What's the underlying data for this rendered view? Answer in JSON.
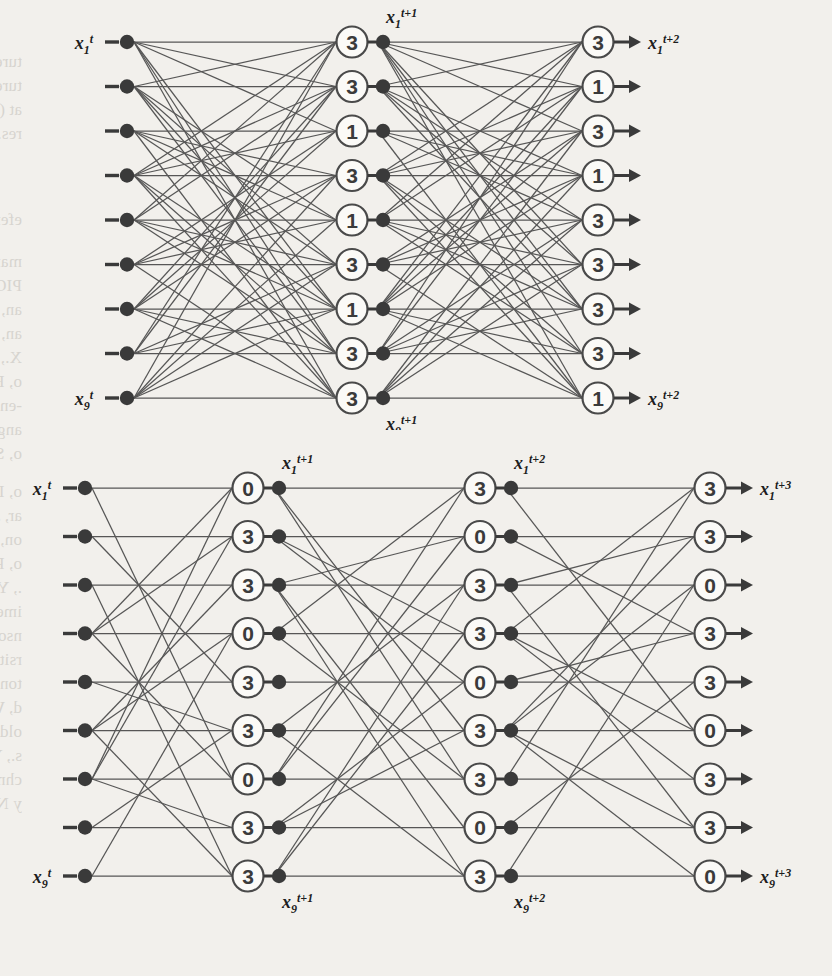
{
  "page": {
    "background_color": "#f2f0ec",
    "ink_color": "#3f3f3f",
    "figure_count": 2
  },
  "bleed_through_text": [
    {
      "t": "ture problems, particularly a novel extension of the CL based learning",
      "x": 22,
      "y": 52
    },
    {
      "t": "tures at the desired point, in addition to the desired PIO, the shift",
      "x": 22,
      "y": 76
    },
    {
      "t": "at (contour slope) BIO curves. In this case, the normalized value is switch",
      "x": 22,
      "y": 100
    },
    {
      "t": "res.",
      "x": 22,
      "y": 124
    },
    {
      "t": "eferences",
      "x": 22,
      "y": 210
    },
    {
      "t": "mand, M., Schoen,  D. :  Deep  Convolutionary  Neural Networks",
      "x": 22,
      "y": 252
    },
    {
      "t": "PIOR From Handwriting.",
      "x": 22,
      "y": 276
    },
    {
      "t": "an, W., Xiong, W.: OUTLI+D (2012) Orient  Binary Neural",
      "x": 22,
      "y": 300
    },
    {
      "t": "an, W.: Learning  CNN-BIO  in  Proc.  IEEE  pp. 1-12 (2017)",
      "x": 22,
      "y": 324
    },
    {
      "t": "X., Xu, S-D., Yao, H.: Deep learning on binary neural networks (2017)",
      "x": 22,
      "y": 348
    },
    {
      "t": "o, R., Santarcangelo, D.: Methods and Learning of Discrete Ordi-",
      "x": 22,
      "y": 372
    },
    {
      "t": "-ended Binary Neural Networks. Int. Proc. LRYY, pp. 302-318 (2012",
      "x": 22,
      "y": 396
    },
    {
      "t": "angelo, A., Suarez, R.: Deep learning for binary neural networks",
      "x": 22,
      "y": 420
    },
    {
      "t": "o, S., Discriminate-neural Networks 3(2), pp.4-2(2) (2019)",
      "x": 22,
      "y": 444
    },
    {
      "t": "o, I.,  Bengio,  Y.: Convolution al Neural network, Proc. IEEE",
      "x": 22,
      "y": 482
    },
    {
      "t": "ar, J.: Deep  learning  of  binary networks, pp. 20-41 (2017)",
      "x": 22,
      "y": 506
    },
    {
      "t": "on, J.: Convolutional  Neural Network  for  Binary  Classification, 10",
      "x": 22,
      "y": 530
    },
    {
      "t": "o, P.: Features  and  Binary  Neural  Network  recognition, 10",
      "x": 22,
      "y": 554
    },
    {
      "t": "., Y., Wang, M.: Binary  network  topologies  and learning, 1, 1",
      "x": 22,
      "y": 578
    },
    {
      "t": "ime-dimensional  processing  Neural  network  pp. 109-204 (2006)",
      "x": 22,
      "y": 602
    },
    {
      "t": "nson, D.: A  fast  learning  algorithms  for  deep  belief  (2006)",
      "x": 22,
      "y": 626
    },
    {
      "t": "rsity  Press, Oxford (2009)",
      "x": 22,
      "y": 650
    },
    {
      "t": "ton, I.E.: Conditional  Restricted  of  Neural  Networks  in  re-",
      "x": 22,
      "y": 674
    },
    {
      "t": "d, W.: Neural  networks  in  conjunction  with  learning, 1 - 11 (1",
      "x": 22,
      "y": 698
    },
    {
      "t": "old, Z.: The  final  negative  memory  and  recursive  neural  collective",
      "x": 22,
      "y": 722
    },
    {
      "t": "s., Y.: Neural  networks  in  recursive  learning, 1, 1 (1999)",
      "x": 22,
      "y": 746
    },
    {
      "t": "chm, Lecture  T.: An  associative  memory  model  on  the  variant  set  h-  B",
      "x": 22,
      "y": 770
    },
    {
      "t": "y  Networks. FGS  Lect. LTTC (2011)",
      "x": 22,
      "y": 794
    }
  ],
  "figures": [
    {
      "id": "top-network",
      "name": "two-step-binary-network",
      "node_rows": 9,
      "layers": [
        {
          "id": "input",
          "label_first": {
            "base": "x",
            "sub": "1",
            "sup": "t"
          },
          "label_last": {
            "base": "x",
            "sub": "9",
            "sup": "t"
          },
          "style": "dot",
          "values": [
            "",
            "",
            "",
            "",
            "",
            "",
            "",
            "",
            ""
          ]
        },
        {
          "id": "hidden1",
          "label_first": {
            "base": "x",
            "sub": "1",
            "sup": "t+1"
          },
          "label_last": {
            "base": "x",
            "sub": "9",
            "sup": "t+1"
          },
          "style": "circle",
          "values": [
            "3",
            "3",
            "1",
            "3",
            "1",
            "3",
            "1",
            "3",
            "3"
          ]
        },
        {
          "id": "output",
          "label_first": {
            "base": "x",
            "sub": "1",
            "sup": "t+2"
          },
          "label_last": {
            "base": "x",
            "sub": "9",
            "sup": "t+2"
          },
          "style": "circle-arrow",
          "values": [
            "3",
            "1",
            "3",
            "1",
            "3",
            "3",
            "3",
            "3",
            "1"
          ]
        }
      ]
    },
    {
      "id": "bottom-network",
      "name": "three-step-binary-network",
      "node_rows": 9,
      "layers": [
        {
          "id": "input",
          "label_first": {
            "base": "x",
            "sub": "1",
            "sup": "t"
          },
          "label_last": {
            "base": "x",
            "sub": "9",
            "sup": "t"
          },
          "style": "dot",
          "values": [
            "",
            "",
            "",
            "",
            "",
            "",
            "",
            "",
            ""
          ]
        },
        {
          "id": "hidden1",
          "label_first": {
            "base": "x",
            "sub": "1",
            "sup": "t+1"
          },
          "label_last": {
            "base": "x",
            "sub": "9",
            "sup": "t+1"
          },
          "style": "circle",
          "values": [
            "0",
            "3",
            "3",
            "0",
            "3",
            "3",
            "0",
            "3",
            "3"
          ]
        },
        {
          "id": "hidden2",
          "label_first": {
            "base": "x",
            "sub": "1",
            "sup": "t+2"
          },
          "label_last": {
            "base": "x",
            "sub": "9",
            "sup": "t+2"
          },
          "style": "circle",
          "values": [
            "3",
            "0",
            "3",
            "3",
            "0",
            "3",
            "3",
            "0",
            "3"
          ]
        },
        {
          "id": "output",
          "label_first": {
            "base": "x",
            "sub": "1",
            "sup": "t+3"
          },
          "label_last": {
            "base": "x",
            "sub": "9",
            "sup": "t+3"
          },
          "style": "circle-arrow",
          "values": [
            "3",
            "3",
            "0",
            "3",
            "3",
            "0",
            "3",
            "3",
            "0"
          ]
        }
      ]
    }
  ]
}
